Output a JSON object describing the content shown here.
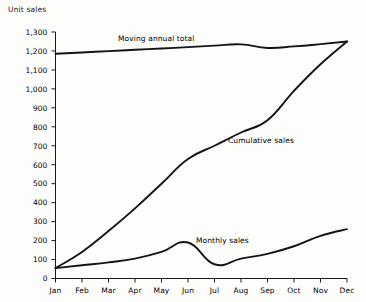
{
  "chart_data": {
    "type": "line",
    "title": "",
    "ylabel": "Unit sales",
    "xlabel": "",
    "ylim": [
      0,
      1300
    ],
    "ytick_labels": [
      "0",
      "100",
      "200",
      "300",
      "400",
      "500",
      "600",
      "700",
      "800",
      "900",
      "1,000",
      "1,100",
      "1,200",
      "1,300"
    ],
    "ytick_values": [
      0,
      100,
      200,
      300,
      400,
      500,
      600,
      700,
      800,
      900,
      1000,
      1100,
      1200,
      1300
    ],
    "categories": [
      "Jan",
      "Feb",
      "Mar",
      "Apr",
      "May",
      "Jun",
      "Jul",
      "Aug",
      "Sep",
      "Oct",
      "Nov",
      "Dec"
    ],
    "grid": false,
    "legend_position": "inline-annotations",
    "series": [
      {
        "name": "Moving annual total",
        "values": [
          1185,
          1192,
          1199,
          1206,
          1213,
          1220,
          1228,
          1235,
          1216,
          1224,
          1236,
          1250
        ]
      },
      {
        "name": "Cumulative sales",
        "values": [
          55,
          140,
          250,
          370,
          500,
          630,
          700,
          770,
          835,
          990,
          1130,
          1250
        ]
      },
      {
        "name": "Monthly sales",
        "values": [
          55,
          70,
          85,
          105,
          140,
          190,
          75,
          105,
          130,
          170,
          225,
          260
        ]
      }
    ],
    "annotations": [
      {
        "text": "Moving annual total",
        "x": 118,
        "y": 41
      },
      {
        "text": "Cumulative sales",
        "x": 228,
        "y": 143
      },
      {
        "text": "Monthly sales",
        "x": 196,
        "y": 243
      }
    ]
  }
}
